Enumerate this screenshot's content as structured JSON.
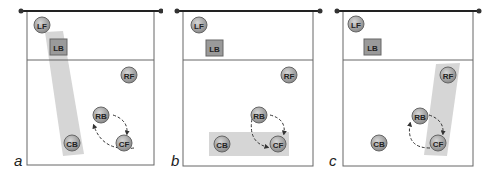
{
  "diagram": {
    "colors": {
      "court_line": "#555555",
      "net": "#222222",
      "player_fill": "#a8a8a8",
      "player_stroke": "#6a6a6a",
      "highlight": "#d4d4d4",
      "arrow": "#333333"
    },
    "panels": [
      {
        "label": "a",
        "highlight": "diagonal LB to CB",
        "players": [
          {
            "id": "LF",
            "shape": "circle"
          },
          {
            "id": "LB",
            "shape": "square"
          },
          {
            "id": "RF",
            "shape": "circle"
          },
          {
            "id": "RB",
            "shape": "circle"
          },
          {
            "id": "CB",
            "shape": "circle"
          },
          {
            "id": "CF",
            "shape": "circle"
          }
        ],
        "rotation": "RB and CF rotate (dashed arrows)"
      },
      {
        "label": "b",
        "highlight": "horizontal CB to CF",
        "players": [
          {
            "id": "LF",
            "shape": "circle"
          },
          {
            "id": "LB",
            "shape": "square"
          },
          {
            "id": "RF",
            "shape": "circle"
          },
          {
            "id": "RB",
            "shape": "circle"
          },
          {
            "id": "CB",
            "shape": "circle"
          },
          {
            "id": "CF",
            "shape": "circle"
          }
        ],
        "rotation": "RB and CF rotate (dashed arrows)"
      },
      {
        "label": "c",
        "highlight": "diagonal RF to CF",
        "players": [
          {
            "id": "LF",
            "shape": "circle"
          },
          {
            "id": "LB",
            "shape": "square"
          },
          {
            "id": "RF",
            "shape": "circle"
          },
          {
            "id": "RB",
            "shape": "circle"
          },
          {
            "id": "CB",
            "shape": "circle"
          },
          {
            "id": "CF",
            "shape": "circle"
          }
        ],
        "rotation": "RB and CF rotate (dashed arrows)"
      }
    ]
  }
}
